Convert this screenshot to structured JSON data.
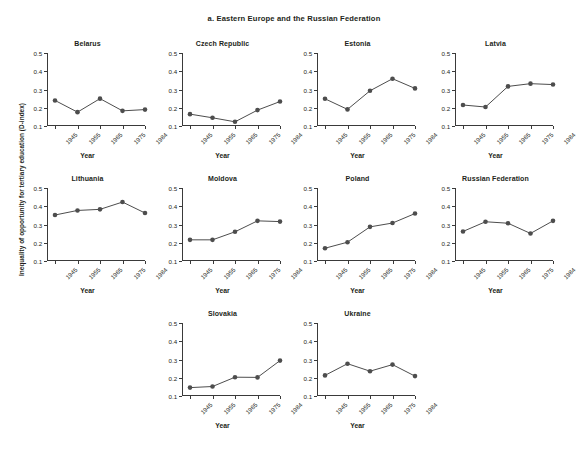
{
  "panel": {
    "title": "a. Eastern Europe and the Russian Federation",
    "y_axis_label": "Inequality of opportunity for tertiary education (D-index)",
    "x_axis_label": "Year"
  },
  "axes": {
    "y_ticks": [
      "0.5",
      "0.4",
      "0.3",
      "0.2",
      "0.1"
    ],
    "x_ticks": [
      "1945",
      "1955",
      "1965",
      "1975",
      "1984"
    ],
    "ylim": [
      0.1,
      0.5
    ],
    "marker_color": "#4d4d4d",
    "line_color": "#4d4d4d",
    "axis_color": "#3a3a3a"
  },
  "chart_data": {
    "type": "line",
    "title": "a. Eastern Europe and the Russian Federation",
    "xlabel": "Year",
    "ylabel": "Inequality of opportunity for tertiary education (D-index)",
    "x": [
      1945,
      1955,
      1965,
      1975,
      1984
    ],
    "x_tick_labels": [
      "1945",
      "1955",
      "1965",
      "1975",
      "1984"
    ],
    "y_tick_labels": [
      "0.1",
      "0.2",
      "0.3",
      "0.4",
      "0.5"
    ],
    "ylim": [
      0.1,
      0.5
    ],
    "grid": false,
    "legend": "none",
    "layout": "small-multiples 4 columns x 3 rows",
    "series": [
      {
        "name": "Belarus",
        "row": 0,
        "col": 0,
        "values": [
          0.24,
          0.176,
          0.25,
          0.183,
          0.19
        ]
      },
      {
        "name": "Czech Republic",
        "row": 0,
        "col": 1,
        "values": [
          0.165,
          0.145,
          0.123,
          0.187,
          0.234
        ]
      },
      {
        "name": "Estonia",
        "row": 0,
        "col": 2,
        "values": [
          0.249,
          0.191,
          0.293,
          0.359,
          0.306
        ]
      },
      {
        "name": "Latvia",
        "row": 0,
        "col": 3,
        "values": [
          0.215,
          0.204,
          0.317,
          0.332,
          0.327
        ]
      },
      {
        "name": "Lithuania",
        "row": 1,
        "col": 0,
        "values": [
          0.352,
          0.377,
          0.383,
          0.423,
          0.363
        ]
      },
      {
        "name": "Moldova",
        "row": 1,
        "col": 1,
        "values": [
          0.216,
          0.216,
          0.26,
          0.32,
          0.316
        ]
      },
      {
        "name": "Poland",
        "row": 1,
        "col": 2,
        "values": [
          0.17,
          0.203,
          0.287,
          0.308,
          0.36
        ]
      },
      {
        "name": "Russian Federation",
        "row": 1,
        "col": 3,
        "values": [
          0.262,
          0.315,
          0.307,
          0.251,
          0.32
        ]
      },
      {
        "name": "Slovakia",
        "row": 2,
        "col": 1,
        "values": [
          0.146,
          0.152,
          0.203,
          0.202,
          0.294
        ]
      },
      {
        "name": "Ukraine",
        "row": 2,
        "col": 2,
        "values": [
          0.213,
          0.277,
          0.236,
          0.272,
          0.209
        ]
      }
    ]
  }
}
